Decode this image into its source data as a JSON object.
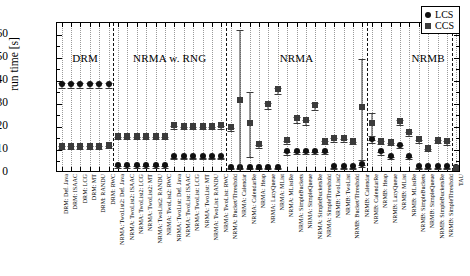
{
  "chart_data": {
    "type": "scatter",
    "title": "",
    "xlabel": "",
    "ylabel": "run time [s]",
    "ylim": [
      0,
      65
    ],
    "yticks": [
      0,
      10,
      20,
      30,
      40,
      50,
      60
    ],
    "grid": "vertical-dotted",
    "legend_position": "top-right",
    "legend": [
      {
        "name": "LCS",
        "marker": "circle"
      },
      {
        "name": "CCS",
        "marker": "square"
      }
    ],
    "groups": [
      {
        "label": "DRM",
        "start": 0,
        "end": 5
      },
      {
        "label": "NRMA w. RNG",
        "start": 6,
        "end": 17
      },
      {
        "label": "NRMA",
        "start": 18,
        "end": 32
      },
      {
        "label": "NRMB",
        "start": 33,
        "end": 45
      }
    ],
    "categories": [
      "DRM: Def. Java",
      "DRM: ISAAC",
      "DRM: LCG",
      "DRM: MT",
      "DRM: RANDU",
      "DRM: RWC",
      "NRMA: TwoList2: Def. Java",
      "NRMA: TwoList2: ISAAC",
      "NRMA: TwoList2: LCG",
      "NRMA: TwoList2: MT",
      "NRMA: TwoList2: RANDU",
      "NRMA: TwoList2: RWC",
      "NRMA: TwoList: Def. Java",
      "NRMA: TwoList: ISAAC",
      "NRMA: TwoList: LCG",
      "NRMA: TwoList: MT",
      "NRMA: TwoList: RANDU",
      "NRMA: TwoList: RWC",
      "NRMA: Bucket/Threshold",
      "NRMA: Calendar",
      "NRMA: CalendarRe",
      "NRMA: Heap",
      "NRMA: LazyQueue",
      "NRMA: MList",
      "NRMA: MListRe",
      "NRMA: SimpleBuckets",
      "NRMA: SimpleQueue",
      "NRMA: SimpleBucketsRe",
      "NRMA: SimpleThreshold",
      "NRMB: TwoList2",
      "NRMB: TwoList",
      "NRMB: Bucket/Threshold",
      "NRMB: Calendar",
      "NRMB: CalendarRe",
      "NRMB: Heap",
      "NRMB: LazyQueue",
      "NRMB: MList",
      "NRMB: MListRe",
      "NRMB: SimpleBuckets",
      "NRMB: SimpleQueue",
      "NRMB: SimpleBucketsRe",
      "NRMB: SimpleThreshold",
      "TAU"
    ],
    "series": [
      {
        "name": "LCS",
        "marker": "circle",
        "values": [
          37.8,
          37.8,
          37.8,
          37.8,
          37.8,
          37.8,
          2.6,
          2.6,
          2.6,
          2.6,
          2.6,
          2.6,
          6.3,
          6.3,
          6.3,
          6.3,
          6.3,
          6.3,
          1.9,
          1.9,
          1.9,
          1.9,
          1.9,
          1.9,
          8.5,
          8.6,
          8.6,
          8.6,
          8.6,
          2.0,
          2.0,
          2.0,
          3.0,
          13.8,
          8.5,
          6.6,
          11.4,
          6.6,
          2.1,
          2.1,
          2.1,
          2.1,
          1.6
        ],
        "errors": [
          1.0,
          1.0,
          1.0,
          1.0,
          1.0,
          1.0,
          0.3,
          0.3,
          0.3,
          0.3,
          0.3,
          0.3,
          0.4,
          0.4,
          0.4,
          0.4,
          0.4,
          0.4,
          0.2,
          0.2,
          0.2,
          0.2,
          0.2,
          0.2,
          0.5,
          0.5,
          0.5,
          0.5,
          0.5,
          0.2,
          0.2,
          0.2,
          0.3,
          0.7,
          0.5,
          0.4,
          0.6,
          0.4,
          0.2,
          0.2,
          0.2,
          0.2,
          0.2
        ]
      },
      {
        "name": "CCS",
        "marker": "square",
        "values": [
          11.0,
          11.0,
          11.0,
          11.0,
          11.0,
          11.4,
          15.2,
          15.2,
          15.1,
          15.1,
          15.1,
          15.1,
          19.8,
          19.4,
          19.4,
          19.4,
          19.4,
          19.8,
          18.9,
          30.8,
          21.0,
          11.6,
          29.0,
          35.6,
          13.3,
          23.0,
          22.0,
          28.7,
          13.2,
          14.4,
          14.2,
          13.0,
          27.6,
          21.0,
          13.2,
          12.6,
          21.8,
          16.8,
          13.8,
          10.0,
          13.6,
          13.0,
          1.3
        ],
        "errors": [
          0.5,
          0.5,
          0.5,
          0.5,
          0.5,
          0.5,
          0.4,
          0.4,
          0.4,
          0.4,
          0.4,
          0.4,
          0.6,
          0.5,
          0.5,
          0.5,
          0.5,
          0.6,
          0.6,
          31.0,
          14.0,
          0.7,
          1.2,
          1.4,
          0.6,
          1.2,
          1.0,
          1.5,
          0.6,
          0.8,
          0.7,
          0.6,
          22.0,
          5.0,
          0.7,
          0.6,
          1.0,
          0.9,
          0.7,
          0.6,
          0.7,
          0.7,
          0.3
        ]
      }
    ]
  },
  "legend": {
    "lcs_label": "LCS",
    "ccs_label": "CCS"
  },
  "axis": {
    "y_title": "run time [s]"
  }
}
